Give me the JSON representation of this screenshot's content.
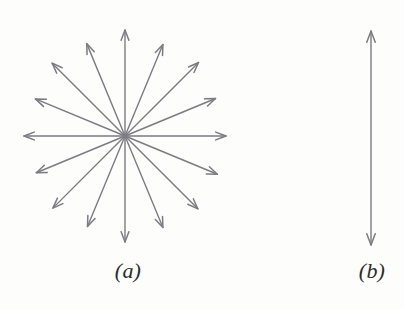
{
  "figure": {
    "background_color": "#fdfdfc",
    "stroke_color": "#7b7b82",
    "label_color": "#2b2b2b",
    "width": 404,
    "height": 310
  },
  "panels": [
    {
      "id": "a",
      "label": "(a)",
      "kind": "radial-starburst",
      "description": "Sixteen double-ended-looking arrows radiating from a common center at 22.5 degree intervals",
      "center": {
        "x": 125,
        "y": 136
      },
      "arrow_count": 16,
      "angle_step_degrees": 22.5,
      "radius_x": 101,
      "radius_y": 106,
      "angles_degrees": [
        0,
        22.5,
        45,
        67.5,
        90,
        112.5,
        135,
        157.5,
        180,
        202.5,
        225,
        247.5,
        270,
        292.5,
        315,
        337.5
      ],
      "arrow_lengths": [
        101,
        98,
        104,
        99,
        106,
        100,
        103,
        97,
        101,
        96,
        102,
        98,
        106,
        99,
        103,
        100
      ]
    },
    {
      "id": "b",
      "label": "(b)",
      "kind": "single-vertical-arrow",
      "description": "One vertical double-headed arrow pointing up and down",
      "x": 371,
      "y_top": 31,
      "y_bottom": 245,
      "length": 214,
      "heads": [
        "up",
        "down"
      ]
    }
  ],
  "labels": {
    "panel_a": "(a)",
    "panel_b": "(b)"
  }
}
